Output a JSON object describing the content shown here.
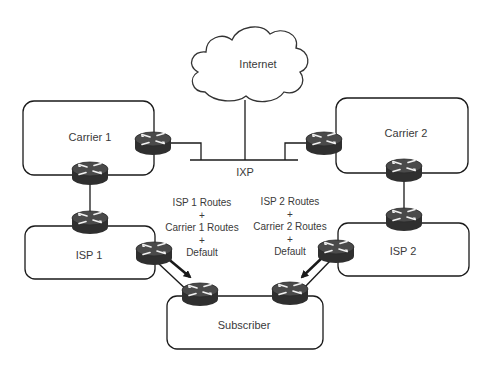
{
  "diagram": {
    "cloud": {
      "label": "Internet"
    },
    "exchange": {
      "label": "IXP"
    },
    "networks": [
      {
        "id": "carrier1",
        "label": "Carrier 1"
      },
      {
        "id": "carrier2",
        "label": "Carrier 2"
      },
      {
        "id": "isp1",
        "label": "ISP 1"
      },
      {
        "id": "isp2",
        "label": "ISP 2"
      },
      {
        "id": "subscriber",
        "label": "Subscriber"
      }
    ],
    "route_notes": [
      {
        "lines": [
          "ISP 1 Routes",
          "+",
          "Carrier 1 Routes",
          "+",
          "Default"
        ]
      },
      {
        "lines": [
          "ISP 2 Routes",
          "+",
          "Carrier 2 Routes",
          "+",
          "Default"
        ]
      }
    ],
    "colors": {
      "line": "#1a1a1a",
      "router_body": "#3a3a3a",
      "router_top": "#555555",
      "text": "#3a3a3a"
    }
  }
}
